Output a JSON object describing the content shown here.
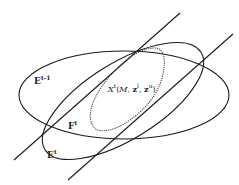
{
  "diagram": {
    "labels": {
      "e_prev": {
        "base": "E",
        "sup": "t-1"
      },
      "f_t": {
        "base": "F",
        "sup": "t"
      },
      "e_t": {
        "base": "E",
        "sup": "t"
      },
      "x_t": {
        "base": "X",
        "sup": "t",
        "args_open": "(",
        "arg1": "M",
        "sep1": ", ",
        "arg2": "z",
        "arg2_sup": "l",
        "sep2": ", ",
        "arg3": "z",
        "arg3_sup": "u",
        "args_close": ")"
      }
    },
    "colors": {
      "stroke": "#1a1a1a",
      "dotted": "#444444",
      "background": "#ffffff"
    }
  }
}
